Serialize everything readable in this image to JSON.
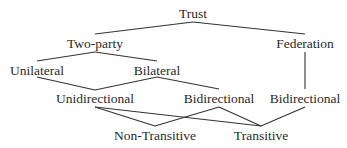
{
  "diagram": {
    "type": "tree",
    "nodes": [
      {
        "id": "trust",
        "label": "Trust",
        "x": 193,
        "y": 14
      },
      {
        "id": "two_party",
        "label": "Two-party",
        "x": 95,
        "y": 44
      },
      {
        "id": "federation",
        "label": "Federation",
        "x": 305,
        "y": 44
      },
      {
        "id": "unilateral",
        "label": "Unilateral",
        "x": 37,
        "y": 71
      },
      {
        "id": "bilateral",
        "label": "Bilateral",
        "x": 157,
        "y": 71
      },
      {
        "id": "unidirectional",
        "label": "Unidirectional",
        "x": 95,
        "y": 99
      },
      {
        "id": "bidirectional_1",
        "label": "Bidirectional",
        "x": 219,
        "y": 99
      },
      {
        "id": "bidirectional_2",
        "label": "Bidirectional",
        "x": 305,
        "y": 99
      },
      {
        "id": "non_transitive",
        "label": "Non-Transitive",
        "x": 155,
        "y": 136
      },
      {
        "id": "transitive",
        "label": "Transitive",
        "x": 261,
        "y": 136
      }
    ],
    "edges": [
      {
        "from": "trust",
        "to": "two_party",
        "x1": 193,
        "y1": 22,
        "x2": 95,
        "y2": 34
      },
      {
        "from": "trust",
        "to": "federation",
        "x1": 193,
        "y1": 22,
        "x2": 305,
        "y2": 34
      },
      {
        "from": "two_party",
        "to": "unilateral",
        "x1": 95,
        "y1": 52,
        "x2": 37,
        "y2": 61
      },
      {
        "from": "two_party",
        "to": "bilateral",
        "x1": 95,
        "y1": 52,
        "x2": 157,
        "y2": 61
      },
      {
        "from": "federation",
        "to": "bidirectional_2",
        "x1": 305,
        "y1": 52,
        "x2": 305,
        "y2": 89
      },
      {
        "from": "unilateral",
        "to": "unidirectional",
        "x1": 37,
        "y1": 77,
        "x2": 95,
        "y2": 90
      },
      {
        "from": "bilateral",
        "to": "unidirectional",
        "x1": 157,
        "y1": 77,
        "x2": 95,
        "y2": 90
      },
      {
        "from": "bilateral",
        "to": "bidirectional_1",
        "x1": 157,
        "y1": 77,
        "x2": 219,
        "y2": 89
      },
      {
        "from": "unidirectional",
        "to": "non_transitive",
        "x1": 95,
        "y1": 107,
        "x2": 155,
        "y2": 126
      },
      {
        "from": "unidirectional",
        "to": "transitive",
        "x1": 95,
        "y1": 107,
        "x2": 261,
        "y2": 126
      },
      {
        "from": "bidirectional_1",
        "to": "non_transitive",
        "x1": 219,
        "y1": 107,
        "x2": 155,
        "y2": 126
      },
      {
        "from": "bidirectional_1",
        "to": "transitive",
        "x1": 219,
        "y1": 107,
        "x2": 261,
        "y2": 126
      },
      {
        "from": "bidirectional_2",
        "to": "transitive",
        "x1": 305,
        "y1": 107,
        "x2": 261,
        "y2": 126
      }
    ],
    "colors": {
      "line": "#333333",
      "text": "#2a2a2a",
      "background": "#ffffff"
    }
  }
}
